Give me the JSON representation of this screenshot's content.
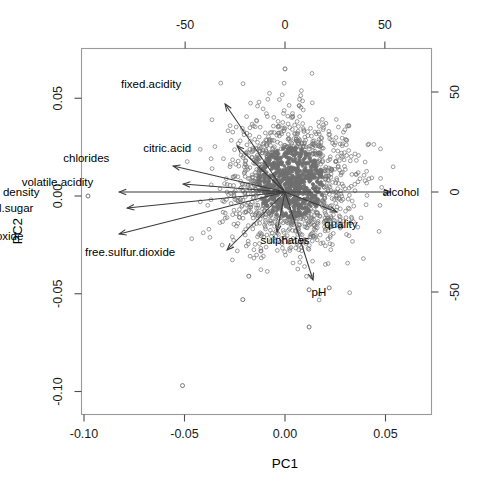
{
  "chart_data": {
    "type": "scatter",
    "title": "",
    "xlabel": "PC1",
    "ylabel": "PC2",
    "xlim": [
      -0.115,
      0.062
    ],
    "ylim": [
      -0.112,
      0.072
    ],
    "grid": false,
    "legend": null,
    "bottom_axis": {
      "name": "PC1",
      "ticks": [
        -0.1,
        -0.05,
        0.0,
        0.05
      ],
      "tick_labels": [
        "-0.10",
        "-0.05",
        "0.00",
        "0.05"
      ]
    },
    "left_axis": {
      "name": "PC2",
      "ticks": [
        0.05,
        0.0,
        -0.05,
        -0.1
      ],
      "tick_labels": [
        "0.05",
        "0.00",
        "-0.05",
        "-0.10"
      ]
    },
    "top_axis": {
      "name": "",
      "ticks": [
        -50,
        0,
        50
      ],
      "tick_labels": [
        "-50",
        "0",
        "50"
      ]
    },
    "right_axis": {
      "name": "",
      "ticks": [
        50,
        0,
        -50
      ],
      "tick_labels": [
        "50",
        "0",
        "-50"
      ]
    },
    "point_color": "#707070",
    "point_marker": "open-circle",
    "arrow_color": "#3a3a3a",
    "arrows": [
      {
        "label": "fixed.acidity",
        "x2": -30,
        "y2": 44,
        "lx": -52,
        "ly": 54
      },
      {
        "label": "citric.acid",
        "x2": -24,
        "y2": 23,
        "lx": -47,
        "ly": 22
      },
      {
        "label": "chlorides",
        "x2": -56,
        "y2": 13,
        "lx": -88,
        "ly": 17
      },
      {
        "label": "volatile.acidity",
        "x2": -51,
        "y2": 4,
        "lx": -96,
        "ly": 5
      },
      {
        "label": "density",
        "x2": -83,
        "y2": 0,
        "lx": -123,
        "ly": 0
      },
      {
        "label": "residual.sugar",
        "x2": -79,
        "y2": -8,
        "lx": -126,
        "ly": -8
      },
      {
        "label": "total.sulfur.dioxide",
        "x2": -83,
        "y2": -21,
        "lx": -131,
        "ly": -22
      },
      {
        "label": "free.sulfur.dioxide",
        "x2": -29,
        "y2": -29,
        "lx": -55,
        "ly": -30
      },
      {
        "label": "sulphates",
        "x2": -4,
        "y2": -20,
        "lx": 0,
        "ly": -24
      },
      {
        "label": "pH",
        "x2": 14,
        "y2": -44,
        "lx": 17,
        "ly": -50
      },
      {
        "label": "quality",
        "x2": 26,
        "y2": -10,
        "lx": 28,
        "ly": -16
      },
      {
        "label": "alcohol",
        "x2": 53,
        "y2": 0,
        "lx": 58,
        "ly": 0
      }
    ],
    "cloud": {
      "description": "dense grey open-circle point cloud of wine samples",
      "center_x": 3,
      "center_y": 5,
      "spread_x": 15,
      "spread_y": 16,
      "n_points": 1600
    },
    "outliers": [
      {
        "x": -0.098,
        "y": 0.0
      },
      {
        "x": -0.051,
        "y": -0.097
      },
      {
        "x": -0.021,
        "y": -0.053
      },
      {
        "x": -0.018,
        "y": -0.041
      },
      {
        "x": 0.012,
        "y": -0.067
      },
      {
        "x": 0.0,
        "y": 0.065
      },
      {
        "x": 0.012,
        "y": -0.048
      },
      {
        "x": 0.022,
        "y": -0.047
      }
    ]
  }
}
